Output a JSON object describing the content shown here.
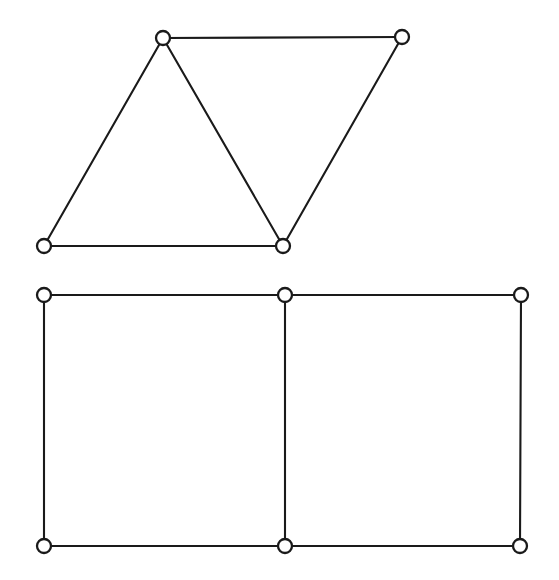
{
  "figure": {
    "background_color": "#ffffff",
    "line_color": "#1a1a1a",
    "node_fill_color": "#ffffff",
    "node_radius": 7,
    "edge_stroke_width": 2.1,
    "width": 559,
    "height": 580
  },
  "chart_data": {
    "type": "diagram",
    "title": "",
    "xlabel": "",
    "ylabel": "",
    "graphs": [
      {
        "name": "upper-graph",
        "description": "Four-vertex graph consisting of two triangles sharing a common vertex region, drawn as a zig-zag strip",
        "vertex_count": 4,
        "edge_count": 5,
        "nodes": [
          {
            "id": "u1",
            "label": "",
            "x": 163,
            "y": 38
          },
          {
            "id": "u2",
            "label": "",
            "x": 402,
            "y": 37
          },
          {
            "id": "u3",
            "label": "",
            "x": 44,
            "y": 246
          },
          {
            "id": "u4",
            "label": "",
            "x": 283,
            "y": 246
          }
        ],
        "edges": [
          {
            "from": "u1",
            "to": "u2"
          },
          {
            "from": "u1",
            "to": "u3"
          },
          {
            "from": "u1",
            "to": "u4"
          },
          {
            "from": "u3",
            "to": "u4"
          },
          {
            "from": "u2",
            "to": "u4"
          }
        ]
      },
      {
        "name": "lower-graph",
        "description": "Six-vertex ladder (2x3 grid) graph forming two adjacent squares",
        "vertex_count": 6,
        "edge_count": 7,
        "nodes": [
          {
            "id": "l1",
            "label": "",
            "x": 44,
            "y": 295
          },
          {
            "id": "l2",
            "label": "",
            "x": 285,
            "y": 295
          },
          {
            "id": "l3",
            "label": "",
            "x": 521,
            "y": 295
          },
          {
            "id": "l4",
            "label": "",
            "x": 44,
            "y": 546
          },
          {
            "id": "l5",
            "label": "",
            "x": 285,
            "y": 546
          },
          {
            "id": "l6",
            "label": "",
            "x": 520,
            "y": 546
          }
        ],
        "edges": [
          {
            "from": "l1",
            "to": "l2"
          },
          {
            "from": "l2",
            "to": "l3"
          },
          {
            "from": "l4",
            "to": "l5"
          },
          {
            "from": "l5",
            "to": "l6"
          },
          {
            "from": "l1",
            "to": "l4"
          },
          {
            "from": "l2",
            "to": "l5"
          },
          {
            "from": "l3",
            "to": "l6"
          }
        ]
      }
    ]
  }
}
